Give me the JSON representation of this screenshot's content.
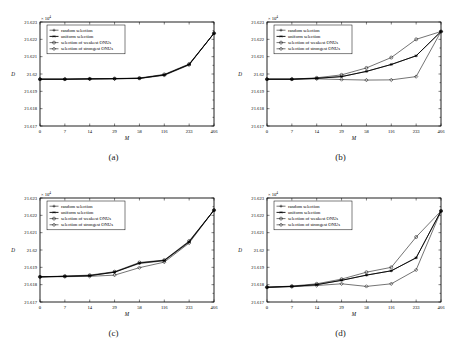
{
  "figure": {
    "axis_label_x": "M",
    "axis_label_y": "D",
    "exponent_label": "× 10",
    "exponent_power": "4",
    "legend": [
      {
        "label": "random selection",
        "marker": "plus"
      },
      {
        "label": "uniform selection",
        "marker": "asterisk"
      },
      {
        "label": "selection of weakest ONUs",
        "marker": "circle"
      },
      {
        "label": "selection of strongest ONUs",
        "marker": "diamond"
      }
    ],
    "captions": {
      "a": "(a)",
      "b": "(b)",
      "c": "(c)",
      "d": "(d)"
    }
  },
  "chart_data": [
    {
      "type": "line",
      "panel": "a",
      "title": "(a)",
      "xlabel": "M",
      "ylabel": "D",
      "categories": [
        "0",
        "7",
        "14",
        "29",
        "58",
        "116",
        "233",
        "466"
      ],
      "x": [
        0,
        7,
        14,
        29,
        58,
        116,
        233,
        466
      ],
      "xtick_labels": [
        "0",
        "7",
        "14",
        "29",
        "58",
        "116",
        "233",
        "466"
      ],
      "ytick_labels": [
        "21.617",
        "21.618",
        "21.619",
        "21.62",
        "21.621",
        "21.622",
        "21.623"
      ],
      "ytick_values": [
        21.617,
        21.618,
        21.619,
        21.62,
        21.621,
        21.622,
        21.623
      ],
      "ylim": [
        21.617,
        21.623
      ],
      "y_multiplier": "×10⁴",
      "grid": false,
      "legend_position": "upper-left",
      "series": [
        {
          "name": "random selection",
          "marker": "plus",
          "values": [
            21.6197,
            21.6197,
            21.61972,
            21.61973,
            21.61975,
            21.61995,
            21.62055,
            21.62235
          ]
        },
        {
          "name": "uniform selection",
          "marker": "asterisk",
          "values": [
            21.6197,
            21.6197,
            21.61972,
            21.61973,
            21.61975,
            21.61995,
            21.62055,
            21.62235
          ]
        },
        {
          "name": "selection of weakest ONUs",
          "marker": "circle",
          "values": [
            21.6197,
            21.6197,
            21.61972,
            21.61974,
            21.61977,
            21.61998,
            21.62058,
            21.62235
          ]
        },
        {
          "name": "selection of strongest ONUs",
          "marker": "diamond",
          "values": [
            21.6197,
            21.6197,
            21.61971,
            21.61972,
            21.61974,
            21.61992,
            21.62052,
            21.62235
          ]
        }
      ]
    },
    {
      "type": "line",
      "panel": "b",
      "title": "(b)",
      "xlabel": "M",
      "ylabel": "D",
      "categories": [
        "0",
        "7",
        "14",
        "29",
        "58",
        "116",
        "233",
        "466"
      ],
      "x": [
        0,
        7,
        14,
        29,
        58,
        116,
        233,
        466
      ],
      "xtick_labels": [
        "0",
        "7",
        "14",
        "29",
        "58",
        "116",
        "233",
        "466"
      ],
      "ytick_labels": [
        "21.617",
        "21.618",
        "21.619",
        "21.62",
        "21.621",
        "21.622",
        "21.623"
      ],
      "ytick_values": [
        21.617,
        21.618,
        21.619,
        21.62,
        21.621,
        21.622,
        21.623
      ],
      "ylim": [
        21.617,
        21.623
      ],
      "y_multiplier": "×10⁴",
      "grid": false,
      "legend_position": "upper-left",
      "series": [
        {
          "name": "random selection",
          "marker": "plus",
          "values": [
            21.6197,
            21.6197,
            21.61975,
            21.61985,
            21.62015,
            21.62055,
            21.62105,
            21.62245
          ]
        },
        {
          "name": "uniform selection",
          "marker": "asterisk",
          "values": [
            21.6197,
            21.6197,
            21.61975,
            21.61985,
            21.62015,
            21.62055,
            21.62105,
            21.62245
          ]
        },
        {
          "name": "selection of weakest ONUs",
          "marker": "circle",
          "values": [
            21.6197,
            21.6197,
            21.61978,
            21.61995,
            21.62035,
            21.62095,
            21.622,
            21.62245
          ]
        },
        {
          "name": "selection of strongest ONUs",
          "marker": "diamond",
          "values": [
            21.6197,
            21.6197,
            21.61972,
            21.61968,
            21.61965,
            21.61966,
            21.61985,
            21.62245
          ]
        }
      ]
    },
    {
      "type": "line",
      "panel": "c",
      "title": "(c)",
      "xlabel": "M",
      "ylabel": "D",
      "categories": [
        "0",
        "7",
        "14",
        "29",
        "58",
        "116",
        "233",
        "466"
      ],
      "x": [
        0,
        7,
        14,
        29,
        58,
        116,
        233,
        466
      ],
      "xtick_labels": [
        "0",
        "7",
        "14",
        "29",
        "58",
        "116",
        "233",
        "466"
      ],
      "ytick_labels": [
        "21.617",
        "21.618",
        "21.619",
        "21.62",
        "21.621",
        "21.622",
        "21.623"
      ],
      "ytick_values": [
        21.617,
        21.618,
        21.619,
        21.62,
        21.621,
        21.622,
        21.623
      ],
      "ylim": [
        21.617,
        21.623
      ],
      "y_multiplier": "×10⁴",
      "grid": false,
      "legend_position": "upper-left",
      "series": [
        {
          "name": "random selection",
          "marker": "plus",
          "values": [
            21.61845,
            21.61848,
            21.61852,
            21.61872,
            21.61922,
            21.61938,
            21.62045,
            21.6223
          ]
        },
        {
          "name": "uniform selection",
          "marker": "asterisk",
          "values": [
            21.61845,
            21.61848,
            21.61852,
            21.61872,
            21.61925,
            21.6194,
            21.62048,
            21.6223
          ]
        },
        {
          "name": "selection of weakest ONUs",
          "marker": "circle",
          "values": [
            21.61845,
            21.6185,
            21.61855,
            21.61875,
            21.61928,
            21.61942,
            21.62052,
            21.6223
          ]
        },
        {
          "name": "selection of strongest ONUs",
          "marker": "diamond",
          "values": [
            21.61845,
            21.61846,
            21.61848,
            21.61855,
            21.61898,
            21.6193,
            21.6204,
            21.6223
          ]
        }
      ]
    },
    {
      "type": "line",
      "panel": "d",
      "title": "(d)",
      "xlabel": "M",
      "ylabel": "D",
      "categories": [
        "0",
        "7",
        "14",
        "29",
        "58",
        "116",
        "233",
        "466"
      ],
      "x": [
        0,
        7,
        14,
        29,
        58,
        116,
        233,
        466
      ],
      "xtick_labels": [
        "0",
        "7",
        "14",
        "29",
        "58",
        "116",
        "233",
        "466"
      ],
      "ytick_labels": [
        "21.617",
        "21.618",
        "21.619",
        "21.62",
        "21.621",
        "21.622",
        "21.623"
      ],
      "ytick_values": [
        21.617,
        21.618,
        21.619,
        21.62,
        21.621,
        21.622,
        21.623
      ],
      "ylim": [
        21.617,
        21.623
      ],
      "y_multiplier": "×10⁴",
      "grid": false,
      "legend_position": "upper-left",
      "series": [
        {
          "name": "random selection",
          "marker": "plus",
          "values": [
            21.61785,
            21.6179,
            21.618,
            21.61825,
            21.61855,
            21.6188,
            21.61955,
            21.62225
          ]
        },
        {
          "name": "uniform selection",
          "marker": "asterisk",
          "values": [
            21.61785,
            21.6179,
            21.618,
            21.61825,
            21.61855,
            21.6188,
            21.61955,
            21.62225
          ]
        },
        {
          "name": "selection of weakest ONUs",
          "marker": "circle",
          "values": [
            21.61785,
            21.61792,
            21.61805,
            21.61832,
            21.61872,
            21.619,
            21.62075,
            21.62225
          ]
        },
        {
          "name": "selection of strongest ONUs",
          "marker": "diamond",
          "values": [
            21.61785,
            21.61788,
            21.61795,
            21.61805,
            21.6179,
            21.61805,
            21.61885,
            21.62225
          ]
        }
      ]
    }
  ]
}
